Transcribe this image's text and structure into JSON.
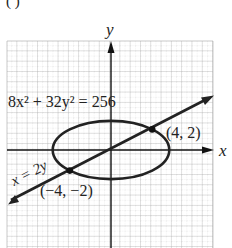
{
  "top_fragment": "(          )",
  "axes": {
    "x_label": "x",
    "y_label": "y"
  },
  "equations": {
    "ellipse": "8x² + 32y² = 256",
    "line": "x = 2y"
  },
  "points": [
    {
      "label": "(4, 2)",
      "x": 4,
      "y": 2
    },
    {
      "label": "(−4, −2)",
      "x": -4,
      "y": -2
    }
  ],
  "colors": {
    "curve": "#222222",
    "grid": "#b5b5b5",
    "grid_minor": "#cfcfcf"
  }
}
